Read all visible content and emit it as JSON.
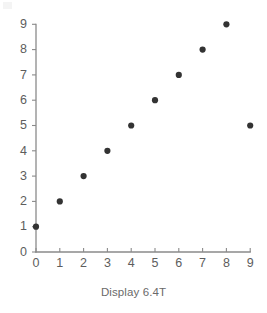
{
  "caption": "Display 6.4T",
  "colors": {
    "point": "#333333",
    "axis": "#8a8a8a",
    "tick_label": "#5d5d5d",
    "caption": "#6a6a6a",
    "background": "#ffffff"
  },
  "chart_data": {
    "type": "scatter",
    "title": "",
    "subtitle": "",
    "xlabel": "",
    "ylabel": "",
    "caption": "Display 6.4T",
    "xlim": [
      0,
      9
    ],
    "ylim": [
      0,
      9
    ],
    "xticks": [
      0,
      1,
      2,
      3,
      4,
      5,
      6,
      7,
      8,
      9
    ],
    "yticks": [
      0,
      1,
      2,
      3,
      4,
      5,
      6,
      7,
      8,
      9
    ],
    "xticklabels": [
      "0",
      "1",
      "2",
      "3",
      "4",
      "5",
      "6",
      "7",
      "8",
      "9"
    ],
    "yticklabels": [
      "0",
      "1",
      "2",
      "3",
      "4",
      "5",
      "6",
      "7",
      "8",
      "9"
    ],
    "grid": false,
    "legend": null,
    "annotations": [],
    "series": [
      {
        "name": "points",
        "marker": "circle",
        "color": "#333333",
        "points": [
          {
            "x": 0,
            "y": 1
          },
          {
            "x": 1,
            "y": 2
          },
          {
            "x": 2,
            "y": 3
          },
          {
            "x": 3,
            "y": 4
          },
          {
            "x": 4,
            "y": 5
          },
          {
            "x": 5,
            "y": 6
          },
          {
            "x": 6,
            "y": 7
          },
          {
            "x": 7,
            "y": 8
          },
          {
            "x": 8,
            "y": 9
          },
          {
            "x": 9,
            "y": 5
          }
        ],
        "x": [
          0,
          1,
          2,
          3,
          4,
          5,
          6,
          7,
          8,
          9
        ],
        "y": [
          1,
          2,
          3,
          4,
          5,
          6,
          7,
          8,
          9,
          5
        ]
      }
    ]
  },
  "geometry": {
    "origin_x": 36,
    "origin_y": 252,
    "x_step": 23.8,
    "y_step": 25.3,
    "point_radius": 3.1,
    "tick_length": 4
  }
}
